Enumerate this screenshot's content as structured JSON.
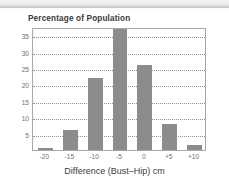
{
  "chart_data": {
    "type": "bar",
    "title": "Percentage of Population",
    "xlabel": "Difference (Bust–Hip) cm",
    "ylabel": "",
    "categories": [
      "-20",
      "-15",
      "-10",
      "-5",
      "0",
      "+5",
      "+10"
    ],
    "values": [
      0.5,
      6,
      22,
      37,
      26,
      8,
      1.5
    ],
    "ylim": [
      0,
      37.5
    ],
    "yticks": [
      5,
      10,
      15,
      20,
      25,
      30,
      35
    ],
    "ytick_labels": [
      "5",
      "10",
      "15",
      "20",
      "25",
      "30",
      "35"
    ],
    "xtick_labels": [
      "-20",
      "-15",
      "-10",
      "-5",
      "0",
      "+5",
      "+10"
    ],
    "grid": "horizontal-dotted",
    "legend": "none",
    "bar_color": "#8c8c8c",
    "grid_color": "#8f8f8f",
    "axis_color": "#a8a8a8",
    "title_color": "#3a3a3a",
    "tick_label_color": "#6f6f6f"
  }
}
